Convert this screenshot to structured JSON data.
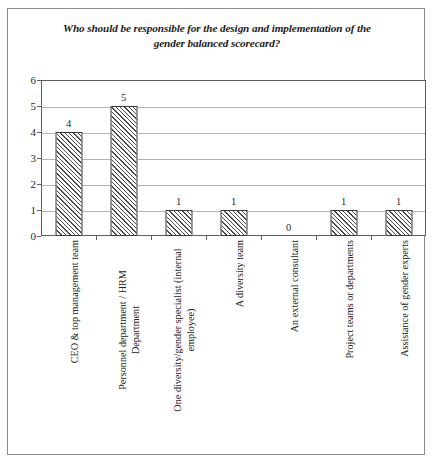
{
  "chart_data": {
    "type": "bar",
    "title": "Who should be responsible for the design and implementation of the gender balanced scorecard?",
    "title_line1": "Who should be responsible for the design and implementation of the",
    "title_line2": "gender balanced scorecard?",
    "xlabel": "",
    "ylabel": "",
    "ylim": [
      0,
      6
    ],
    "yticks": [
      0,
      1,
      2,
      3,
      4,
      5,
      6
    ],
    "grid": true,
    "legend": false,
    "categories": [
      "CEO & top management team",
      "Personnel department / HRM Department",
      "One diversity/gender specialist (internal employee)",
      "A diversity team",
      "An external consultant",
      "Project teams or departments",
      "Assistance of gender experts"
    ],
    "category_lines": [
      [
        "CEO & top management team"
      ],
      [
        "Personnel department / HRM",
        "Department"
      ],
      [
        "One diversity/gender specialist (internal",
        "employee)"
      ],
      [
        "A diversity team"
      ],
      [
        "An external consultant"
      ],
      [
        "Project teams or departments"
      ],
      [
        "Assistance of gender experts"
      ]
    ],
    "values": [
      4,
      5,
      1,
      1,
      0,
      1,
      1
    ],
    "value_labels": [
      "4",
      "5",
      "1",
      "1",
      "0",
      "1",
      "1"
    ],
    "bar_fill": "hatch-diagonal",
    "bar_edge_color": "#3b3b3b",
    "gridline_color": "#b4b4b4",
    "axis_color": "#5d5d5d",
    "frame_color": "#8a8a8a",
    "text_color": "#222222"
  },
  "caption": {
    "text": ""
  }
}
